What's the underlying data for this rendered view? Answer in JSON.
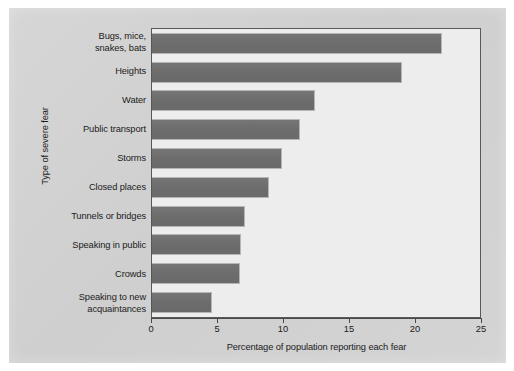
{
  "chart_data": {
    "type": "bar",
    "orientation": "horizontal",
    "title": "",
    "xlabel": "Percentage of population reporting each fear",
    "ylabel": "Type of severe fear",
    "categories": [
      "Bugs, mice, snakes, bats",
      "Heights",
      "Water",
      "Public transport",
      "Storms",
      "Closed places",
      "Tunnels or bridges",
      "Speaking in public",
      "Crowds",
      "Speaking to new acquaintances"
    ],
    "category_lines": [
      [
        "Bugs, mice,",
        "snakes, bats"
      ],
      [
        "Heights"
      ],
      [
        "Water"
      ],
      [
        "Public transport"
      ],
      [
        "Storms"
      ],
      [
        "Closed places"
      ],
      [
        "Tunnels or bridges"
      ],
      [
        "Speaking in public"
      ],
      [
        "Crowds"
      ],
      [
        "Speaking to new",
        "acquaintances"
      ]
    ],
    "values": [
      21.9,
      18.9,
      12.3,
      11.1,
      9.8,
      8.8,
      7.0,
      6.7,
      6.6,
      4.5
    ],
    "xlim": [
      0,
      25
    ],
    "xticks": [
      0,
      5,
      10,
      15,
      20,
      25
    ],
    "xtick_labels": [
      "0",
      "5",
      "10",
      "15",
      "20",
      "25"
    ],
    "grid": false,
    "legend": false,
    "bar_color": "#6f6f6f",
    "plot_background": "#ededed",
    "page_background": "#d2d2d2"
  }
}
